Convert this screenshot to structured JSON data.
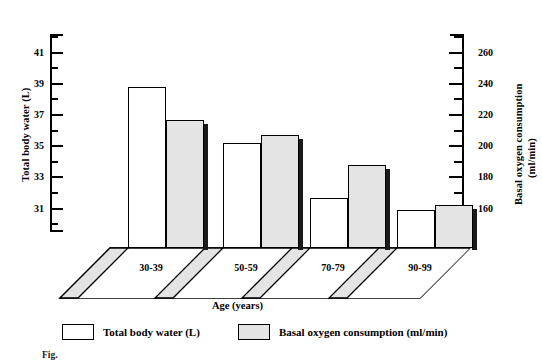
{
  "chart_data": {
    "type": "bar",
    "title": "",
    "xlabel": "Age  (years)",
    "categories": [
      "30-39",
      "50-59",
      "70-79",
      "90-99"
    ],
    "series": [
      {
        "name": "Total body water (L)",
        "axis": "left",
        "unit": "L",
        "color": "#ffffff",
        "values": [
          38.8,
          35.2,
          31.7,
          30.9
        ]
      },
      {
        "name": "Basal oxygen consumption (ml/min)",
        "axis": "right",
        "unit": "ml/min",
        "color": "#e4e4e4",
        "values": [
          217,
          207,
          188,
          162
        ]
      }
    ],
    "left_axis": {
      "label": "Total body water (L)",
      "ticks": [
        41,
        39,
        37,
        35,
        33,
        31
      ],
      "minor_ticks": [
        42,
        40,
        38,
        36,
        34,
        32,
        30
      ],
      "ylim": [
        29.5,
        42.2
      ],
      "tick_step": 2
    },
    "right_axis": {
      "label_line1": "Basal oxygen consumption",
      "label_line2": "(ml/min)",
      "ticks": [
        260,
        240,
        220,
        200,
        180,
        160
      ],
      "minor_ticks": [
        270,
        250,
        230,
        210,
        190,
        170,
        150
      ],
      "ylim": [
        145,
        272
      ],
      "tick_step": 20
    },
    "grid": false,
    "legend_position": "bottom",
    "style": "3d-perspective-floor"
  },
  "legend": {
    "items": [
      {
        "label": "Total body water (L)",
        "swatch": "white"
      },
      {
        "label": "Basal oxygen consumption (ml/min)",
        "swatch": "grey"
      }
    ]
  },
  "caption": "Fig.",
  "colors": {
    "bar_white": "#ffffff",
    "bar_grey": "#e4e4e4",
    "bar_side_shadow": "#1a1a1a",
    "floor_fill": "#e4e4e4",
    "ink": "#000000"
  }
}
